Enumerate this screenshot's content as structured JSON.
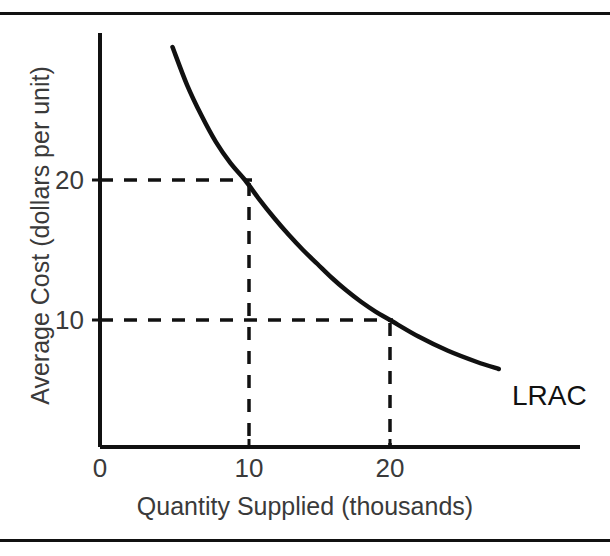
{
  "figure": {
    "background_color": "#ffffff",
    "frame": {
      "top_rule_color": "#111111",
      "bottom_rule_color": "#111111"
    }
  },
  "chart_data": {
    "type": "line",
    "title": "",
    "xlabel": "Quantity Supplied (thousands)",
    "ylabel": "Average Cost (dollars per unit)",
    "xlim": [
      0,
      32
    ],
    "ylim": [
      0,
      32
    ],
    "grid": false,
    "legend_position": "inline-end-of-curve",
    "axis_color": "#111111",
    "curve_color": "#111111",
    "guide_color": "#111111",
    "xticks": [
      {
        "value": 0,
        "label": "0"
      },
      {
        "value": 10,
        "label": "10"
      },
      {
        "value": 20,
        "label": "20"
      }
    ],
    "yticks": [
      {
        "value": 10,
        "label": "10"
      },
      {
        "value": 20,
        "label": "20"
      }
    ],
    "series": [
      {
        "name": "LRAC",
        "label": "LRAC",
        "description": "Long-run average cost curve, downward sloping and convex",
        "points": [
          {
            "x": 5.0,
            "y": 29.5
          },
          {
            "x": 6.0,
            "y": 26.8
          },
          {
            "x": 7.0,
            "y": 24.6
          },
          {
            "x": 8.0,
            "y": 22.7
          },
          {
            "x": 9.0,
            "y": 21.2
          },
          {
            "x": 10.0,
            "y": 20.0
          },
          {
            "x": 11.0,
            "y": 18.6
          },
          {
            "x": 12.0,
            "y": 17.3
          },
          {
            "x": 13.0,
            "y": 16.1
          },
          {
            "x": 14.0,
            "y": 15.0
          },
          {
            "x": 15.0,
            "y": 14.0
          },
          {
            "x": 16.0,
            "y": 13.0
          },
          {
            "x": 17.0,
            "y": 12.1
          },
          {
            "x": 18.0,
            "y": 11.3
          },
          {
            "x": 19.0,
            "y": 10.6
          },
          {
            "x": 20.0,
            "y": 10.0
          },
          {
            "x": 22.0,
            "y": 8.8
          },
          {
            "x": 24.0,
            "y": 7.8
          },
          {
            "x": 26.0,
            "y": 7.0
          },
          {
            "x": 27.5,
            "y": 6.5
          }
        ]
      }
    ],
    "annotations": [
      {
        "name": "guide-q10-c20",
        "type": "dashed-guide",
        "x": 10,
        "y": 20,
        "note": "Quantity 10 thousand corresponds to average cost of 20 dollars per unit"
      },
      {
        "name": "guide-q20-c10",
        "type": "dashed-guide",
        "x": 20,
        "y": 10,
        "note": "Quantity 20 thousand corresponds to average cost of 10 dollars per unit"
      }
    ]
  }
}
